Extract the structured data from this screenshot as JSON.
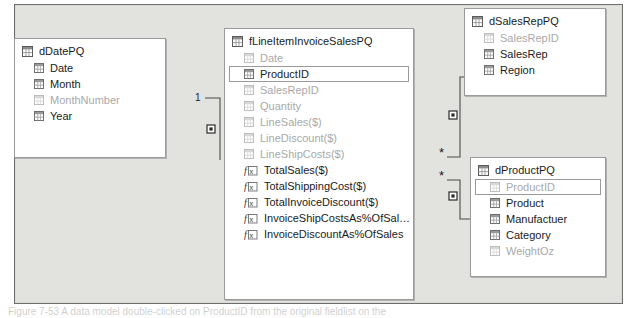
{
  "app": {
    "view_name": "Data Model Diagram View",
    "canvas_background": "#d6d6d2",
    "table_background": "#ffffff",
    "border_color": "#9a9a9a",
    "hidden_field_color": "#a9a9a9",
    "text_color": "#1b1b1b"
  },
  "caption": {
    "text": "Figure 7-53 A data model double-clicked on ProductID from the original fieldlist on the"
  },
  "tables": [
    {
      "id": "dDatePQ",
      "name": "dDatePQ",
      "icon": "table-icon",
      "x": 14,
      "y": 38,
      "width": 152,
      "height": 120,
      "fields": [
        {
          "name": "Date",
          "icon": "column-icon",
          "hidden": false,
          "selected": false
        },
        {
          "name": "Month",
          "icon": "column-icon",
          "hidden": false,
          "selected": false
        },
        {
          "name": "MonthNumber",
          "icon": "column-icon",
          "hidden": true,
          "selected": false
        },
        {
          "name": "Year",
          "icon": "column-icon",
          "hidden": false,
          "selected": false
        }
      ]
    },
    {
      "id": "fLineItemInvoiceSalesPQ",
      "name": "fLineItemInvoiceSalesPQ",
      "icon": "table-icon",
      "x": 224,
      "y": 28,
      "width": 190,
      "height": 272,
      "fields": [
        {
          "name": "Date",
          "icon": "column-icon",
          "hidden": true,
          "selected": false
        },
        {
          "name": "ProductID",
          "icon": "column-icon",
          "hidden": false,
          "selected": true
        },
        {
          "name": "SalesRepID",
          "icon": "column-icon",
          "hidden": true,
          "selected": false
        },
        {
          "name": "Quantity",
          "icon": "column-icon",
          "hidden": true,
          "selected": false
        },
        {
          "name": "LineSales($)",
          "icon": "column-icon",
          "hidden": true,
          "selected": false
        },
        {
          "name": "LineDiscount($)",
          "icon": "column-icon",
          "hidden": true,
          "selected": false
        },
        {
          "name": "LineShipCosts($)",
          "icon": "column-icon",
          "hidden": true,
          "selected": false
        },
        {
          "name": "TotalSales($)",
          "icon": "measure-icon",
          "hidden": false,
          "selected": false
        },
        {
          "name": "TotalShippingCost($)",
          "icon": "measure-icon",
          "hidden": false,
          "selected": false
        },
        {
          "name": "TotalInvoiceDiscount($)",
          "icon": "measure-icon",
          "hidden": false,
          "selected": false
        },
        {
          "name": "InvoiceShipCostsAs%OfSal…",
          "icon": "measure-icon",
          "hidden": false,
          "selected": false
        },
        {
          "name": "InvoiceDiscountAs%OfSales",
          "icon": "measure-icon",
          "hidden": false,
          "selected": false
        }
      ]
    },
    {
      "id": "dSalesRepPQ",
      "name": "dSalesRepPQ",
      "icon": "table-icon",
      "x": 464,
      "y": 8,
      "width": 142,
      "height": 88,
      "fields": [
        {
          "name": "SalesRepID",
          "icon": "column-icon",
          "hidden": true,
          "selected": false
        },
        {
          "name": "SalesRep",
          "icon": "column-icon",
          "hidden": false,
          "selected": false
        },
        {
          "name": "Region",
          "icon": "column-icon",
          "hidden": false,
          "selected": false
        }
      ]
    },
    {
      "id": "dProductPQ",
      "name": "dProductPQ",
      "icon": "table-icon",
      "x": 470,
      "y": 157,
      "width": 136,
      "height": 120,
      "fields": [
        {
          "name": "ProductID",
          "icon": "column-icon",
          "hidden": true,
          "selected": true
        },
        {
          "name": "Product",
          "icon": "column-icon",
          "hidden": false,
          "selected": false
        },
        {
          "name": "Manufactuer",
          "icon": "column-icon",
          "hidden": false,
          "selected": false
        },
        {
          "name": "Category",
          "icon": "column-icon",
          "hidden": false,
          "selected": false
        },
        {
          "name": "WeightOz",
          "icon": "column-icon",
          "hidden": true,
          "selected": false
        }
      ]
    }
  ],
  "relationships": [
    {
      "id": "date-to-fact",
      "from_table": "dDatePQ",
      "to_table": "fLineItemInvoiceSalesPQ",
      "one_label": "1",
      "many_label": "*",
      "one_label_x": 180,
      "one_label_y": 88,
      "many_label_x": 209,
      "many_label_y": 157,
      "marker_x": 196,
      "marker_y": 124,
      "path": "M 190 93 L 205 93 L 205 155"
    },
    {
      "id": "salesrep-to-fact",
      "from_table": "dSalesRepPQ",
      "to_table": "fLineItemInvoiceSalesPQ",
      "one_label": "1",
      "many_label": "*",
      "one_label_x": 460,
      "one_label_y": 67,
      "many_label_x": 424,
      "many_label_y": 145,
      "marker_x": 438,
      "marker_y": 110,
      "path": "M 456 72 L 445 72 L 445 152 L 432 152"
    },
    {
      "id": "product-to-fact",
      "from_table": "dProductPQ",
      "to_table": "fLineItemInvoiceSalesPQ",
      "one_label": "1",
      "many_label": "*",
      "one_label_x": 460,
      "one_label_y": 209,
      "many_label_x": 424,
      "many_label_y": 168,
      "marker_x": 438,
      "marker_y": 191,
      "path": "M 432 175 L 445 175 L 445 214 L 456 214"
    }
  ]
}
